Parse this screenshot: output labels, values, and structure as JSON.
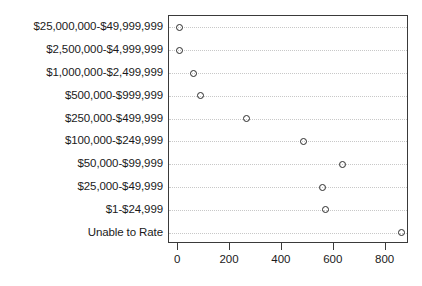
{
  "chart_data": {
    "type": "scatter",
    "subtype": "dot-plot",
    "title": "",
    "subtitle": "",
    "xlabel": "",
    "ylabel": "",
    "categories": [
      "$25,000,000-$49,999,999",
      "$2,500,000-$4,999,999",
      "$1,000,000-$2,499,999",
      "$500,000-$999,999",
      "$250,000-$499,999",
      "$100,000-$249,999",
      "$50,000-$99,999",
      "$25,000-$49,999",
      "$1-$24,999",
      "Unable to Rate"
    ],
    "values": [
      5,
      7,
      60,
      85,
      262,
      485,
      635,
      555,
      568,
      862
    ],
    "xlim": [
      -35,
      890
    ],
    "xticks": [
      0,
      200,
      400,
      600,
      800
    ],
    "xticklabels": [
      "0",
      "200",
      "400",
      "600",
      "800"
    ],
    "grid": "horizontal-dotted",
    "legend": "none",
    "marker": "open-circle",
    "marker_color": "#2b2b2b",
    "grid_color": "#c8c8c8",
    "frame_color": "#3a3a3a"
  }
}
